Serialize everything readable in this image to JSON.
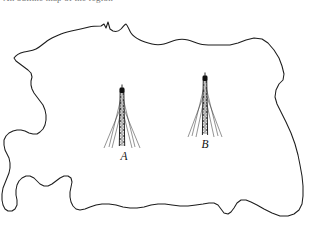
{
  "page": {
    "width": 312,
    "height": 225,
    "background_color": "#ffffff",
    "kind": "line-drawn outline map with two transmitter masts"
  },
  "top_caption": {
    "text": "An outline map of the region",
    "visible": "clipped at top edge of image",
    "color": "#5a5a5a"
  },
  "map": {
    "outline_name": "region-coastline-outline",
    "stroke_color": "#1c1c1c",
    "fill_color": "#ffffff",
    "stroke_width": 1.05
  },
  "masts": [
    {
      "id": "A",
      "label": "A",
      "label_x": 124,
      "label_y": 160,
      "base_x": 122,
      "base_y": 146,
      "top_y": 88,
      "color": "#101010",
      "description": "lattice transmitter mast with guy wires"
    },
    {
      "id": "B",
      "label": "B",
      "label_x": 205,
      "label_y": 148,
      "base_x": 205,
      "base_y": 135,
      "top_y": 76,
      "color": "#101010",
      "description": "lattice transmitter mast with guy wires"
    }
  ],
  "chart_data": {
    "type": "map",
    "points": [
      {
        "label": "A",
        "x": 122,
        "y": 146
      },
      {
        "label": "B",
        "x": 205,
        "y": 135
      }
    ],
    "legend": [],
    "grid": false
  }
}
